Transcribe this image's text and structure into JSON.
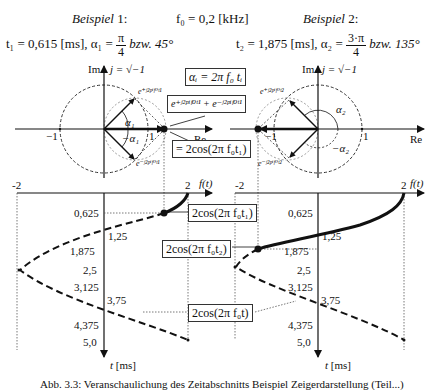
{
  "header": {
    "example1_title": "Beispiel",
    "example1_num": "1:",
    "example2_title": "Beispiel",
    "example2_num": "2:",
    "frequency": "f₀ = 0,2  [kHz]",
    "ex1_time": "t₁ = 0,615  [ms],  α₁ =",
    "ex1_frac_num": "π",
    "ex1_frac_den": "4",
    "ex1_deg": "bzw.  45°",
    "ex2_time": "t₂ = 1,875  [ms],  α₂ =",
    "ex2_frac_num": "3·π",
    "ex2_frac_den": "4",
    "ex2_deg": "bzw.  135°"
  },
  "phasor_left": {
    "im_label": "Im",
    "j_label": "j = √−1",
    "re_label": "Re",
    "minus_one": "−1",
    "one": "1",
    "alpha": "α₁",
    "minus_alpha": "−α₁",
    "e_plus": "e⁺ʲ²ᵖⁱᶠ⁰ᵗ¹",
    "e_minus": "e⁻ʲ²ᵖⁱᶠ⁰ᵗ¹"
  },
  "phasor_right": {
    "im_label": "Im",
    "j_label": "j = √−1",
    "re_label": "Re",
    "minus_one": "−1",
    "one": "1",
    "alpha": "α₂",
    "minus_alpha": "−α₂",
    "e_plus": "e⁺ʲ²ᵖⁱᶠ⁰ᵗ²",
    "e_minus": "e⁻ʲ²ᵖⁱᶠ⁰ᵗ²"
  },
  "boxes": {
    "alpha_def": "αᵢ = 2π f₀ tᵢ",
    "sum": "e⁺ʲ²ᵖⁱᶠ⁰ᵗ¹ + e⁻ʲ²ᵖⁱᶠ⁰ᵗ¹",
    "equals_cos": "= 2cos(2π f₀t₁)",
    "cos_t1": "2cos(2π f₀t₁)",
    "cos_t2": "2cos(2π f₀t₂)",
    "cos_t": "2cos(2π f₀t)"
  },
  "time_axes": {
    "left": {
      "min": "-2",
      "max": "2",
      "f_label": "f(t)",
      "t_label": "t [ms]"
    },
    "right": {
      "min": "-2",
      "max": "2",
      "f_label": "f(t)",
      "t_label": "t [ms]"
    },
    "ticks": [
      "0,625",
      "1,25",
      "1,875",
      "2,5",
      "3,125",
      "3,75",
      "4,375",
      "5,0"
    ]
  },
  "caption": "Abb. 3.3:  Veranschaulichung des Zeitabschnitts  Beispiel  Zeigerdarstellung  (Teil...)"
}
